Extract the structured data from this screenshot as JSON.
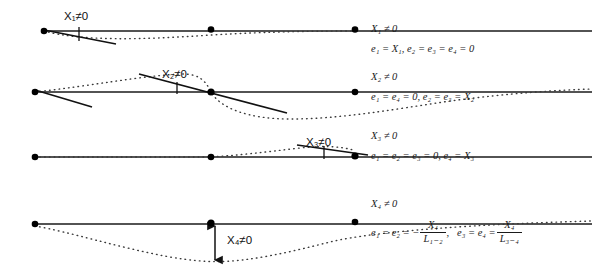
{
  "figure": {
    "colors": {
      "beam": "#1a1a1a",
      "node": "#000000",
      "deflected": "#3a3a3a",
      "tangent": "#111111",
      "text": "#1a1a1a",
      "background": "#ffffff"
    },
    "rows": [
      {
        "id": "state-1",
        "baseline_y": 31,
        "diagram_label": "X₁≠0",
        "label_x": 64,
        "label_y": 12,
        "heading": "X₁ ≠ 0",
        "equation": "e₁ = X₁, e₂ = e₃ = e₄ = 0",
        "nodes_x": [
          44,
          211,
          355
        ],
        "description": "Rotation applied at left support; deflected shape dips just right of the left node then returns to the beam axis."
      },
      {
        "id": "state-2",
        "baseline_y": 92,
        "diagram_label": "X₂≠0",
        "label_x": 162,
        "label_y": 70,
        "heading": "X₂ ≠ 0",
        "equation": "e₁ = e₄ = 0, e₂ = e₃ = X₂",
        "nodes_x": [
          35,
          211,
          355
        ],
        "description": "Rotation applied at the interior support; deflected shape arcs above the axis in the left span and below it in the right span."
      },
      {
        "id": "state-3",
        "baseline_y": 157,
        "diagram_label": "X₃≠0",
        "label_x": 306,
        "label_y": 138,
        "heading": "X₃ ≠ 0",
        "equation": "e₁ = e₂ = e₃ = 0, e₄ = X₃",
        "nodes_x": [
          35,
          211,
          355
        ],
        "description": "Rotation applied at the right support; deflected shape rises above the axis only in the right span."
      },
      {
        "id": "state-4",
        "baseline_y": 224,
        "diagram_label": "X₄≠0",
        "label_x": 227,
        "label_y": 236,
        "heading": "X₄ ≠ 0",
        "equation_left_num": "X₄",
        "equation_left_den": "L₁₋₂",
        "equation_right_num": "X₄",
        "equation_right_den": "L₃₋₄",
        "equation_left_prefix": "e₁ = e₂ = −",
        "equation_right_prefix": "e₃ = e₄ =",
        "equation_separator": ",",
        "nodes_x": [
          35,
          211,
          355
        ],
        "description": "Vertical settlement of the interior support; both spans sag below the beam axis."
      }
    ],
    "annotations": {
      "arrow_label_row4": "X₄≠0",
      "arrow_top_y": 224,
      "arrow_bottom_y": 262
    }
  }
}
